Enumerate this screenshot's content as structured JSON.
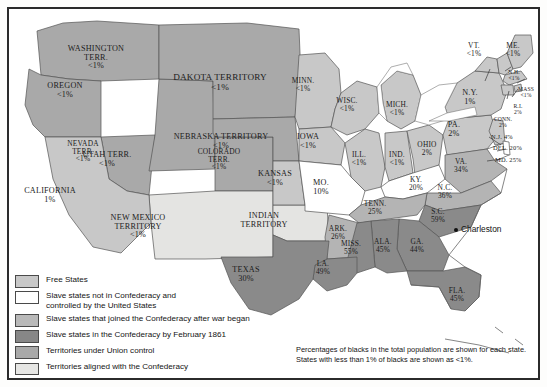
{
  "map": {
    "title": "Slavery and Secession in the United States, 1861",
    "city": {
      "name": "Charleston"
    },
    "footnote": {
      "line1": "Percentages of blacks in the total population are shown for each state.",
      "line2": "States with less than 1% of blacks are shown as <1%."
    }
  },
  "legend": {
    "items": [
      {
        "label": "Free States",
        "swatch": "sw-free",
        "color": "#c8c8c8"
      },
      {
        "label": "Slave states not in Confederacy and\ncontrolled by the United States",
        "swatch": "sw-slave-union",
        "color": "#ffffff"
      },
      {
        "label": "Slave states that joined the Confederacy after war began",
        "swatch": "sw-joined",
        "color": "#b9b9b9"
      },
      {
        "label": "Slave states in the Confederacy by February 1861",
        "swatch": "sw-confed",
        "color": "#878787"
      },
      {
        "label": "Territories under Union control",
        "swatch": "sw-terr-union",
        "color": "#a9a9a9"
      },
      {
        "label": "Territories aligned with the Confederacy",
        "swatch": "sw-terr-confed",
        "color": "#e6e6e4"
      }
    ]
  },
  "regions": {
    "washington_terr": {
      "name": "WASHINGTON\nTERR.",
      "pct": "<1%"
    },
    "oregon": {
      "name": "OREGON",
      "pct": "<1%"
    },
    "california": {
      "name": "CALIFORNIA",
      "pct": "1%"
    },
    "nevada_terr": {
      "name": "NEVADA\nTERR.",
      "pct": "<1%"
    },
    "utah_terr": {
      "name": "UTAH TERR.",
      "pct": "<1%"
    },
    "colorado_terr": {
      "name": "COLORADO\nTERR.",
      "pct": "<1%"
    },
    "new_mexico_terr": {
      "name": "NEW MEXICO\nTERRITORY",
      "pct": "<1%"
    },
    "dakota_terr": {
      "name": "DAKOTA TERRITORY",
      "pct": "<1%"
    },
    "nebraska_terr": {
      "name": "NEBRASKA TERRITORY",
      "pct": "<1%"
    },
    "indian_terr": {
      "name": "INDIAN\nTERRITORY",
      "pct": ""
    },
    "kansas": {
      "name": "KANSAS",
      "pct": "<1%"
    },
    "minnesota": {
      "name": "MINN.",
      "pct": "<1%"
    },
    "iowa": {
      "name": "IOWA",
      "pct": "<1%"
    },
    "missouri": {
      "name": "MO.",
      "pct": "10%"
    },
    "wisconsin": {
      "name": "WISC.",
      "pct": "<1%"
    },
    "illinois": {
      "name": "ILL.",
      "pct": "<1%"
    },
    "michigan": {
      "name": "MICH.",
      "pct": "<1%"
    },
    "indiana": {
      "name": "IND.",
      "pct": "<1%"
    },
    "ohio": {
      "name": "OHIO",
      "pct": "2%"
    },
    "kentucky": {
      "name": "KY.",
      "pct": "20%"
    },
    "tennessee": {
      "name": "TENN.",
      "pct": "25%"
    },
    "arkansas": {
      "name": "ARK.",
      "pct": "26%"
    },
    "texas": {
      "name": "TEXAS",
      "pct": "30%"
    },
    "louisiana": {
      "name": "LA.",
      "pct": "49%"
    },
    "mississippi": {
      "name": "MISS.",
      "pct": "55%"
    },
    "alabama": {
      "name": "ALA.",
      "pct": "45%"
    },
    "georgia": {
      "name": "GA.",
      "pct": "44%"
    },
    "florida": {
      "name": "FLA.",
      "pct": "45%"
    },
    "south_carolina": {
      "name": "S.C.",
      "pct": "59%"
    },
    "north_carolina": {
      "name": "N.C.",
      "pct": "36%"
    },
    "virginia": {
      "name": "VA.",
      "pct": "34%"
    },
    "maryland": {
      "name": "MD. 25%",
      "pct": ""
    },
    "delaware": {
      "name": "DEL. 20%",
      "pct": ""
    },
    "new_jersey": {
      "name": "N.J. 4%",
      "pct": ""
    },
    "pennsylvania": {
      "name": "PA.",
      "pct": "2%"
    },
    "new_york": {
      "name": "N.Y.",
      "pct": "1%"
    },
    "vermont": {
      "name": "VT.",
      "pct": "<1%"
    },
    "new_hampshire": {
      "name": "N.H.",
      "pct": "<1%"
    },
    "maine": {
      "name": "ME.",
      "pct": "<1%"
    },
    "massachusetts": {
      "name": "MASS",
      "pct": "<1%"
    },
    "rhode_island": {
      "name": "R.I.",
      "pct": "2%"
    },
    "connecticut": {
      "name": "CONN.",
      "pct": "2%"
    }
  }
}
